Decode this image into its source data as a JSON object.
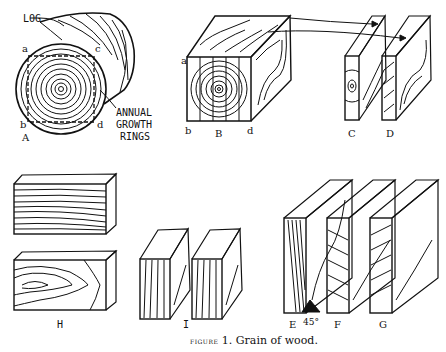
{
  "figure": {
    "caption_prefix": "figure",
    "caption_number": "1.",
    "caption_text": "Grain of wood."
  },
  "labels": {
    "log": "LOG",
    "annual_growth_rings": [
      "ANNUAL",
      "GROWTH",
      "RINGS"
    ],
    "corner_a": "a",
    "corner_b": "b",
    "corner_c": "c",
    "corner_d": "d",
    "A": "A",
    "B": "B",
    "C": "C",
    "D": "D",
    "E": "E",
    "F": "F",
    "G": "G",
    "H": "H",
    "I": "I",
    "angle": "45°"
  },
  "colors": {
    "ink": "#111111",
    "paper": "#ffffff"
  }
}
